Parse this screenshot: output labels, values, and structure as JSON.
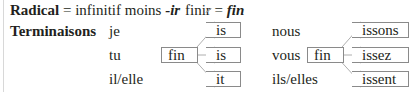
{
  "header": {
    "radical_label": "Radical",
    "radical_rule": " = infinitif moins ",
    "radical_suffix": "-ir",
    "example_infinitive_stem": "fini",
    "example_infinitive_removed": "r",
    "example_equals": " = ",
    "example_radical": "fin"
  },
  "terminaisons": {
    "label": "Terminaisons",
    "radical": "fin",
    "singular": [
      {
        "pronoun": "je",
        "ending": "is"
      },
      {
        "pronoun": "tu",
        "ending": "is"
      },
      {
        "pronoun": "il/elle",
        "ending": "it"
      }
    ],
    "plural": [
      {
        "pronoun": "nous",
        "ending": "issons"
      },
      {
        "pronoun": "vous",
        "ending": "issez"
      },
      {
        "pronoun": "ils/elles",
        "ending": "issent"
      }
    ]
  },
  "colors": {
    "text": "#231f20",
    "box_border": "#8a8a8a",
    "connector": "#9a9a9a"
  }
}
